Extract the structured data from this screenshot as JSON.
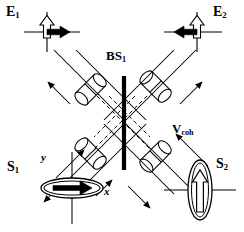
{
  "figure": {
    "type": "optics-schematic",
    "title_caption": "",
    "background": "#ffffff",
    "stroke": "#000000",
    "size": {
      "width": 244,
      "height": 232
    }
  },
  "labels": {
    "e1": {
      "base": "E",
      "sub": "1",
      "x": 6,
      "y": 5
    },
    "e2": {
      "base": "E",
      "sub": "2",
      "x": 213,
      "y": 5
    },
    "bs1": {
      "base": "BS",
      "sub": "1",
      "x": 106,
      "y": 49
    },
    "vcoh": {
      "base": "V",
      "sub": "coh",
      "x": 172,
      "y": 122
    },
    "s1": {
      "base": "S",
      "sub": "1",
      "x": 7,
      "y": 160
    },
    "s2": {
      "base": "S",
      "sub": "2",
      "x": 216,
      "y": 157
    },
    "axis_y": {
      "base": "y",
      "x": 41,
      "y": 152
    },
    "axis_x": {
      "base": "x",
      "x": 104,
      "y": 186
    }
  },
  "components": {
    "beamsplitter": {
      "name": "BS1",
      "shape": "vertical-bar",
      "x": 124,
      "y_top": 76,
      "y_bottom": 168,
      "thickness": 4,
      "color": "#000000"
    },
    "cylinders": [
      {
        "name": "cylinder-upper-left",
        "cx": 92,
        "cy": 88,
        "angle": -45
      },
      {
        "name": "cylinder-upper-right",
        "cx": 157,
        "cy": 88,
        "angle": 45
      },
      {
        "name": "cylinder-lower-left",
        "cx": 92,
        "cy": 155,
        "angle": 45
      },
      {
        "name": "cylinder-lower-right",
        "cx": 157,
        "cy": 155,
        "angle": -45
      }
    ],
    "polarization_states": [
      {
        "name": "S1",
        "shape": "horizontal-ellipse",
        "cx": 72,
        "cy": 188,
        "rx": 31,
        "ry": 10,
        "arrow": "right-solid",
        "axes": true
      },
      {
        "name": "S2",
        "shape": "vertical-ellipse",
        "cx": 200,
        "cy": 190,
        "rx": 12,
        "ry": 30,
        "arrow": "up-hollow",
        "axes": true
      }
    ],
    "fields": [
      {
        "name": "E1",
        "cross_cx": 47,
        "cross_cy": 31,
        "hollow_arrow": "up",
        "solid_arrow": "right"
      },
      {
        "name": "E2",
        "cross_cx": 197,
        "cross_cy": 31,
        "hollow_arrow": "up",
        "solid_arrow": "left"
      }
    ]
  },
  "beams": {
    "style": "solid-diagonal-pairs",
    "dashed_inner": true,
    "arrow_count": 6,
    "description": "Four diagonal beam channels crossing at the beam splitter, each pair carrying an input and an output arrow; dashed lines mark the internally reflected paths."
  }
}
